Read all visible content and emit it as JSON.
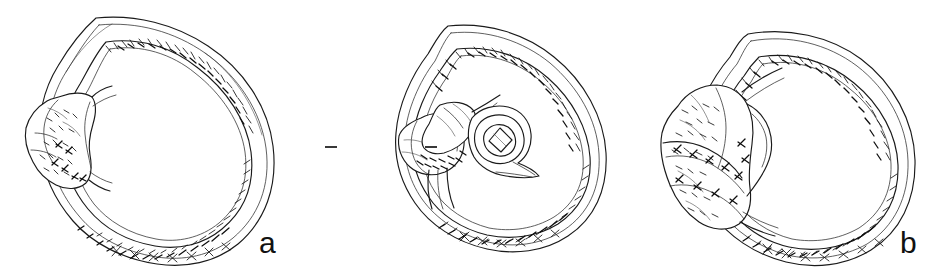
{
  "plate": {
    "type": "archaeological-line-drawing-plate",
    "subject": "Three corroded finger rings shown in profile with bezel settings",
    "background_color": "#ffffff",
    "ink_color": "#1a1a1a",
    "width": 946,
    "height": 275,
    "figure_count": 3
  },
  "figures": [
    {
      "id": "a",
      "label": "a",
      "caption_label": "a",
      "description": "Finger ring, profile view, with encrusted/corroded bezel at left",
      "views": [
        "profile"
      ],
      "has_section_inset": false,
      "has_section_marks": false,
      "bezel_position": "left",
      "label_x": 259,
      "label_y": 228
    },
    {
      "id": "b",
      "label": "b",
      "caption_label": "b",
      "description": "Finger ring, profile view with bezel at left, accompanied by a cross-section drawing of the bezel and its setting",
      "views": [
        "profile",
        "cross-section"
      ],
      "has_section_inset": true,
      "has_section_marks": true,
      "section_marks_count": 2,
      "bezel_position": "left",
      "label_x": 580,
      "label_y": 228
    },
    {
      "id": "c",
      "label": "c",
      "caption_label": "c",
      "description": "Finger ring, profile view, with large irregular corroded bezel mass at left",
      "views": [
        "profile"
      ],
      "has_section_inset": false,
      "has_section_marks": false,
      "bezel_position": "left",
      "label_x": 910,
      "label_y": 228
    }
  ]
}
